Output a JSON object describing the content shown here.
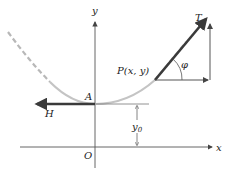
{
  "diagram": {
    "type": "catenary-tension-forces",
    "labels": {
      "y_axis": "y",
      "x_axis": "x",
      "origin": "O",
      "point_a": "A",
      "point_p": "P(x, y)",
      "tension": "T",
      "horizontal_force": "H",
      "angle": "φ",
      "height": "y",
      "height_sub": "0"
    },
    "colors": {
      "axis": "#555555",
      "curve_dashed": "#b8b8b8",
      "curve_solid": "#c4c4c4",
      "force_arrow": "#3a3a3a",
      "component_arrow": "#555555"
    }
  }
}
